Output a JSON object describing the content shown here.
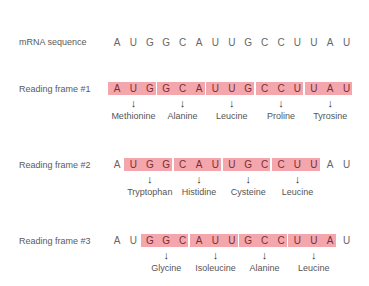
{
  "diagram": {
    "mrna_label": "mRNA sequence",
    "mrna_sequence": [
      "A",
      "U",
      "G",
      "G",
      "C",
      "A",
      "U",
      "U",
      "G",
      "C",
      "C",
      "U",
      "U",
      "A",
      "U"
    ],
    "frames": [
      {
        "label": "Reading frame #1",
        "offset": 0,
        "codons": [
          {
            "bases": [
              "A",
              "U",
              "G"
            ],
            "amino_acid": "Methionine"
          },
          {
            "bases": [
              "G",
              "C",
              "A"
            ],
            "amino_acid": "Alanine"
          },
          {
            "bases": [
              "U",
              "U",
              "G"
            ],
            "amino_acid": "Leucine"
          },
          {
            "bases": [
              "C",
              "C",
              "U"
            ],
            "amino_acid": "Proline"
          },
          {
            "bases": [
              "U",
              "A",
              "U"
            ],
            "amino_acid": "Tyrosine"
          }
        ]
      },
      {
        "label": "Reading frame #2",
        "offset": 1,
        "codons": [
          {
            "bases": [
              "U",
              "G",
              "G"
            ],
            "amino_acid": "Tryptophan"
          },
          {
            "bases": [
              "C",
              "A",
              "U"
            ],
            "amino_acid": "Histidine"
          },
          {
            "bases": [
              "U",
              "G",
              "C"
            ],
            "amino_acid": "Cysteine"
          },
          {
            "bases": [
              "C",
              "U",
              "U"
            ],
            "amino_acid": "Leucine"
          }
        ]
      },
      {
        "label": "Reading frame #3",
        "offset": 2,
        "codons": [
          {
            "bases": [
              "G",
              "G",
              "C"
            ],
            "amino_acid": "Glycine"
          },
          {
            "bases": [
              "A",
              "U",
              "U"
            ],
            "amino_acid": "Isoleucine"
          },
          {
            "bases": [
              "G",
              "C",
              "C"
            ],
            "amino_acid": "Alanine"
          },
          {
            "bases": [
              "U",
              "U",
              "A"
            ],
            "amino_acid": "Leucine"
          }
        ]
      }
    ],
    "colors": {
      "codon_box": "#f3a7ad",
      "codon_text": "#7a2e34",
      "plain_text": "#666666"
    },
    "arrow_glyph": "↓"
  }
}
